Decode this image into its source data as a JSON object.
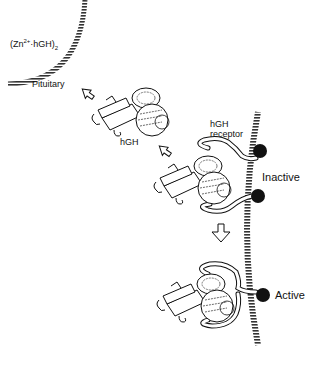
{
  "diagram": {
    "labels": {
      "complex_prefix": "(Zn",
      "complex_sup": "2+",
      "complex_mid": "·hGH)",
      "complex_sub": "2",
      "pituitary": "Pituitary",
      "hgh": "hGH",
      "receptor_line1": "hGH",
      "receptor_line2": "receptor",
      "inactive": "Inactive",
      "active": "Active"
    },
    "colors": {
      "ink": "#111111",
      "background": "#ffffff",
      "hatch": "#555555"
    },
    "stages": [
      {
        "name": "secretion",
        "from": "Pituitary",
        "molecule": "(Zn2+·hGH)2"
      },
      {
        "name": "free hormone",
        "molecule": "hGH"
      },
      {
        "name": "receptor binding",
        "state": "Inactive"
      },
      {
        "name": "receptor dimerization",
        "state": "Active"
      }
    ]
  }
}
